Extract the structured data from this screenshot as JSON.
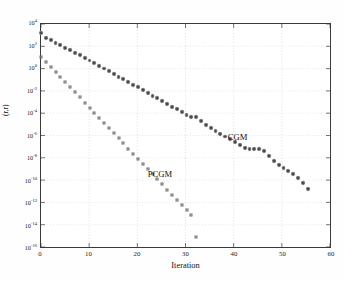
{
  "chart_data": {
    "type": "scatter",
    "title": "",
    "xlabel": "Iteration",
    "ylabel": "(r,r)",
    "xlim": [
      0,
      60
    ],
    "ylim": [
      1e-16,
      10000.0
    ],
    "yscale": "log",
    "xscale": "linear",
    "grid": true,
    "grid_style": "dotted",
    "legend_position": "inline-annotation",
    "xticks": [
      0,
      10,
      20,
      30,
      40,
      50,
      60
    ],
    "xticklabels": [
      "0",
      "10",
      "20",
      "30",
      "40",
      "50",
      "60"
    ],
    "yticks": [
      10000.0,
      100.0,
      1.0,
      0.01,
      0.0001,
      1e-06,
      1e-08,
      1e-10,
      1e-12,
      1e-14,
      1e-16
    ],
    "yticklabels": [
      {
        "mantissa": "10",
        "exponent": "4"
      },
      {
        "mantissa": "10",
        "exponent": "2"
      },
      {
        "mantissa": "10",
        "exponent": "0"
      },
      {
        "mantissa": "10",
        "exponent": "-2"
      },
      {
        "mantissa": "10",
        "exponent": "-4"
      },
      {
        "mantissa": "10",
        "exponent": "-6"
      },
      {
        "mantissa": "10",
        "exponent": "-8"
      },
      {
        "mantissa": "10",
        "exponent": "-10"
      },
      {
        "mantissa": "10",
        "exponent": "-12"
      },
      {
        "mantissa": "10",
        "exponent": "-14"
      },
      {
        "mantissa": "10",
        "exponent": "-16"
      }
    ],
    "series": [
      {
        "name": "CGM",
        "marker": "filled-circle",
        "color": "#4a4a4a",
        "label_x": 38.5,
        "label_y": 2e-06,
        "x": [
          0,
          1,
          2,
          3,
          4,
          5,
          6,
          7,
          8,
          9,
          10,
          11,
          12,
          13,
          14,
          15,
          16,
          17,
          18,
          19,
          20,
          21,
          22,
          23,
          24,
          25,
          26,
          27,
          28,
          29,
          30,
          31,
          32,
          33,
          34,
          35,
          36,
          37,
          38,
          39,
          40,
          41,
          42,
          43,
          44,
          45,
          46,
          47,
          48,
          49,
          50,
          51,
          52,
          53,
          54,
          55
        ],
        "y": [
          1600.0,
          600.0,
          360.0,
          220.0,
          130.0,
          75.0,
          45.0,
          27.0,
          16.0,
          9.5,
          5.6,
          3.2,
          1.9,
          1.1,
          0.64,
          0.37,
          0.21,
          0.12,
          0.07,
          0.04,
          0.023,
          0.013,
          0.0076,
          0.0043,
          0.0025,
          0.0014,
          0.0008,
          0.00045,
          0.00026,
          0.00014,
          8e-05,
          5.5e-05,
          5e-05,
          2.2e-05,
          1.1e-05,
          6e-06,
          3.2e-06,
          1.7e-06,
          1e-06,
          5.5e-07,
          3e-07,
          1.6e-07,
          9e-08,
          7.5e-08,
          7e-08,
          7e-08,
          5e-08,
          2e-08,
          7e-09,
          3e-09,
          1.6e-09,
          9e-10,
          5e-10,
          2e-10,
          7e-11,
          2.2e-11
        ]
      },
      {
        "name": "PCGM",
        "marker": "open-square",
        "color": "#6d6d6d",
        "label_x": 22.0,
        "label_y": 1.1e-09,
        "x": [
          0,
          1,
          2,
          3,
          4,
          5,
          6,
          7,
          8,
          9,
          10,
          11,
          12,
          13,
          14,
          15,
          16,
          17,
          18,
          19,
          20,
          21,
          22,
          23,
          24,
          25,
          26,
          27,
          28,
          29,
          30,
          31,
          32
        ],
        "y": [
          11.0,
          4.0,
          1.5,
          0.55,
          0.2,
          0.07,
          0.024,
          0.0085,
          0.003,
          0.001,
          0.00036,
          0.00013,
          4.5e-05,
          1.6e-05,
          5.5e-06,
          1.9e-06,
          6.8e-07,
          2.4e-07,
          8.5e-08,
          3e-08,
          1e-08,
          3.6e-09,
          1.3e-09,
          4.5e-10,
          1.6e-10,
          5.5e-11,
          1.9e-11,
          6.5e-12,
          2.3e-12,
          8e-13,
          2.8e-13,
          1e-13,
          1.2e-15
        ]
      }
    ]
  }
}
